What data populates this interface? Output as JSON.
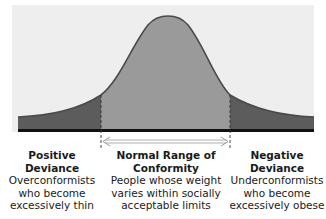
{
  "figure": {
    "type": "normal-distribution-diagram",
    "colors": {
      "background_panel": "#eeeeee",
      "center_fill": "#9a9a9a",
      "tail_fill": "#5c5c5c",
      "curve_stroke": "#4a4a4a",
      "baseline": "#111111",
      "text": "#1a1a1a"
    }
  },
  "regions": [
    {
      "id": "positive-deviance",
      "title": "Positive Deviance",
      "title_lines": [
        "Positive",
        "Deviance"
      ],
      "description_lines": [
        "Overconformists",
        "who become",
        "excessively thin"
      ]
    },
    {
      "id": "normal-range",
      "title": "Normal Range of Conformity",
      "title_lines": [
        "Normal Range of",
        "Conformity"
      ],
      "description_lines": [
        "People whose weight",
        "varies within socially",
        "acceptable limits"
      ]
    },
    {
      "id": "negative-deviance",
      "title": "Negative Deviance",
      "title_lines": [
        "Negative",
        "Deviance"
      ],
      "description_lines": [
        "Underconformists",
        "who become",
        "excessively obese"
      ]
    }
  ],
  "annotations": {
    "range_arrow": "double-headed arrow spanning the normal range"
  }
}
